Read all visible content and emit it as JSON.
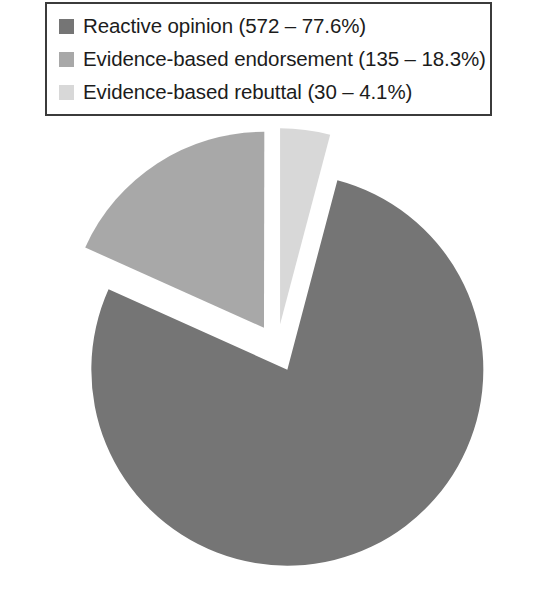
{
  "chart_data": {
    "type": "pie",
    "title": "",
    "subtitle": "",
    "xlabel": "",
    "ylabel": "",
    "grid": false,
    "legend_position": "top",
    "exploded": true,
    "total": 737,
    "categories": [
      "Reactive opinion",
      "Evidence-based endorsement",
      "Evidence-based rebuttal"
    ],
    "values": [
      572,
      135,
      30
    ],
    "percentages": [
      77.6,
      18.3,
      4.1
    ],
    "colors": [
      "#757575",
      "#a8a8a8",
      "#d8d8d8"
    ],
    "slices": [
      {
        "name": "Reactive opinion",
        "value": 572,
        "percent": 77.6,
        "color": "#757575",
        "start_angle_deg": 14.8,
        "sweep_deg": 279.4
      },
      {
        "name": "Evidence-based endorsement",
        "value": 135,
        "percent": 18.3,
        "color": "#a8a8a8",
        "start_angle_deg": 294.2,
        "sweep_deg": 65.9
      },
      {
        "name": "Evidence-based rebuttal",
        "value": 30,
        "percent": 4.1,
        "color": "#d8d8d8",
        "start_angle_deg": 0.0,
        "sweep_deg": 14.8
      }
    ]
  },
  "legend": {
    "items": [
      {
        "swatch_name": "legend-swatch-reactive-opinion",
        "color": "#757575",
        "label": "Reactive opinion (572 – 77.6%)"
      },
      {
        "swatch_name": "legend-swatch-evidence-based-endorsement",
        "color": "#a8a8a8",
        "label": "Evidence-based endorsement (135 – 18.3%)"
      },
      {
        "swatch_name": "legend-swatch-evidence-based-rebuttal",
        "color": "#d8d8d8",
        "label": "Evidence-based rebuttal (30 – 4.1%)"
      }
    ]
  }
}
